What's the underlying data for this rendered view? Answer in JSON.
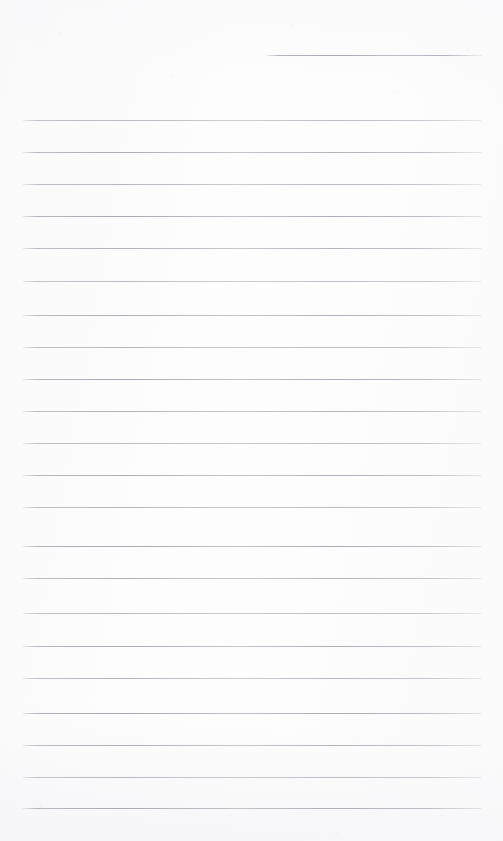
{
  "document": {
    "kind": "scanned-ruled-notebook-page",
    "title": "Blank Ruled Notebook Page",
    "page_width": 503,
    "page_height": 841,
    "has_text_content": false,
    "written_content": "",
    "background_color": "#fdfdfd",
    "rule_color": "#a8a8b2"
  },
  "ruling": {
    "left_margin_x": 23,
    "right_margin_x": 481,
    "line_spacing": 32.3,
    "line_thickness": 1,
    "full_line_count": 22,
    "partial_line_count": 1,
    "first_full_line_y": 120,
    "last_full_line_y": 808,
    "partial_line": {
      "label": "top-right partial rule",
      "x": 266,
      "y": 55,
      "width": 216
    },
    "full_lines": [
      {
        "y": 120
      },
      {
        "y": 152
      },
      {
        "y": 184
      },
      {
        "y": 216
      },
      {
        "y": 248
      },
      {
        "y": 281
      },
      {
        "y": 315
      },
      {
        "y": 347
      },
      {
        "y": 379
      },
      {
        "y": 411
      },
      {
        "y": 443
      },
      {
        "y": 475
      },
      {
        "y": 507
      },
      {
        "y": 546
      },
      {
        "y": 578
      },
      {
        "y": 613
      },
      {
        "y": 646
      },
      {
        "y": 678
      },
      {
        "y": 713
      },
      {
        "y": 745
      },
      {
        "y": 777
      },
      {
        "y": 808
      }
    ]
  }
}
